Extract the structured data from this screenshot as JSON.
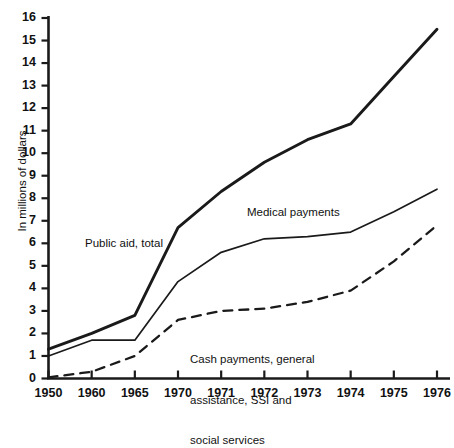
{
  "chart_data": {
    "type": "line",
    "title": "",
    "xlabel": "",
    "ylabel": "In millions of dollars",
    "categories": [
      "1950",
      "1960",
      "1965",
      "1970",
      "1971",
      "1972",
      "1973",
      "1974",
      "1975",
      "1976"
    ],
    "ylim": [
      0,
      16
    ],
    "yticks": [
      0,
      1,
      2,
      3,
      4,
      5,
      6,
      7,
      8,
      9,
      10,
      11,
      12,
      13,
      14,
      15,
      16
    ],
    "grid": false,
    "legend_position": "inline-annotations",
    "series": [
      {
        "name": "Public aid, total",
        "style": "solid-thick",
        "color": "#1a1a1a",
        "values": [
          1.3,
          2.0,
          2.8,
          6.7,
          8.3,
          9.6,
          10.6,
          11.3,
          13.4,
          15.5
        ]
      },
      {
        "name": "Medical payments",
        "style": "solid-thin",
        "color": "#1a1a1a",
        "values": [
          1.0,
          1.7,
          1.7,
          4.3,
          5.6,
          6.2,
          6.3,
          6.5,
          7.4,
          8.4
        ]
      },
      {
        "name": "Cash payments, general assistance, SSI and social services",
        "style": "dashed",
        "color": "#1a1a1a",
        "values": [
          0.05,
          0.3,
          1.0,
          2.6,
          3.0,
          3.1,
          3.4,
          3.9,
          5.2,
          6.8
        ]
      }
    ],
    "annotations": [
      {
        "id": "public",
        "text": "Public aid, total"
      },
      {
        "id": "medical",
        "text": "Medical payments"
      },
      {
        "id": "cash_line1",
        "text": "Cash payments, general"
      },
      {
        "id": "cash_line2",
        "text": "assistance, SSI and"
      },
      {
        "id": "cash_line3",
        "text": "social services"
      }
    ]
  }
}
